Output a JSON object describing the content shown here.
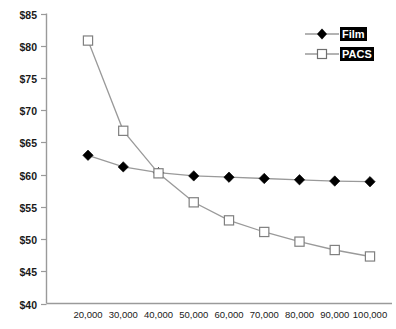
{
  "chart_data": {
    "type": "line",
    "title": "",
    "subtitle": "",
    "xlabel": "",
    "ylabel": "",
    "x": [
      20000,
      30000,
      40000,
      50000,
      60000,
      70000,
      80000,
      90000,
      100000
    ],
    "x_tick_labels": [
      "20,000",
      "30,000",
      "40,000",
      "50,000",
      "60,000",
      "70,000",
      "80,000",
      "90,000",
      "100,000"
    ],
    "y_tick_labels": [
      "$85",
      "$80",
      "$75",
      "$70",
      "$65",
      "$60",
      "$55",
      "$50",
      "$45",
      "$40"
    ],
    "y_ticks": [
      85,
      80,
      75,
      70,
      65,
      60,
      55,
      50,
      45,
      40
    ],
    "ylim": [
      40,
      85
    ],
    "grid": false,
    "legend_position": "top-right",
    "series": [
      {
        "name": "Film",
        "marker": "filled-diamond",
        "color": "#000000",
        "line_color": "#9a9a9a",
        "values": [
          63.0,
          61.2,
          60.3,
          59.8,
          59.6,
          59.4,
          59.2,
          59.0,
          58.9
        ]
      },
      {
        "name": "PACS",
        "marker": "open-square",
        "color": "#ffffff",
        "line_color": "#9a9a9a",
        "values": [
          80.8,
          66.8,
          60.2,
          55.7,
          52.9,
          51.1,
          49.6,
          48.3,
          47.3
        ]
      }
    ]
  },
  "legend": {
    "items": [
      {
        "label": "Film",
        "marker": "filled-diamond"
      },
      {
        "label": "PACS",
        "marker": "open-square"
      }
    ]
  },
  "colors": {
    "axis": "#9a9a9a",
    "line": "#9a9a9a",
    "film_marker": "#000000",
    "pacs_marker_fill": "#ffffff",
    "pacs_marker_stroke": "#808080",
    "legend_label_bg": "#000000",
    "legend_label_fg": "#ffffff",
    "background": "#ffffff"
  }
}
